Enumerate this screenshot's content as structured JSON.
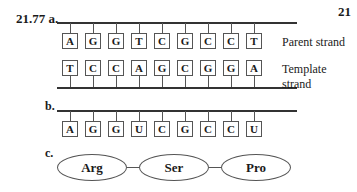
{
  "problem": {
    "number": "21.77",
    "page_number_partial": "21",
    "top_fragment": "",
    "part_a": {
      "label": "a.",
      "parent_strand": [
        "A",
        "G",
        "G",
        "T",
        "C",
        "G",
        "C",
        "C",
        "T"
      ],
      "template_strand": [
        "T",
        "C",
        "C",
        "A",
        "G",
        "C",
        "G",
        "G",
        "A"
      ],
      "parent_label": "Parent strand",
      "template_label": "Template strand"
    },
    "part_b": {
      "label": "b.",
      "mrna_strand": [
        "A",
        "G",
        "G",
        "U",
        "C",
        "G",
        "C",
        "C",
        "U"
      ]
    },
    "part_c": {
      "label": "c.",
      "amino_acids": [
        "Arg",
        "Ser",
        "Pro"
      ]
    }
  }
}
